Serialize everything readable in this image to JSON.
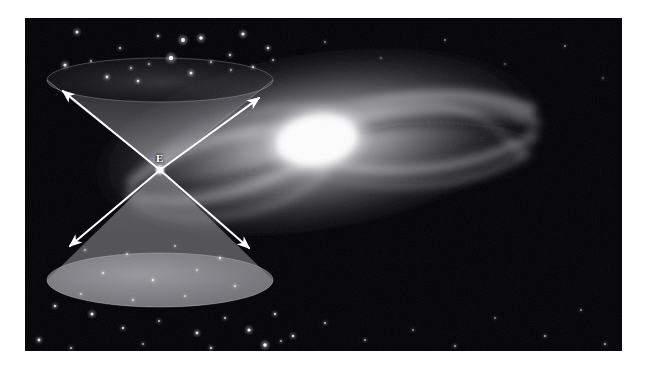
{
  "figure": {
    "kind": "astronomy-light-cone-diagram",
    "background_color": "#ffffff",
    "photo": {
      "x": 25,
      "y": 18,
      "width": 597,
      "height": 333,
      "sky_color": "#030305",
      "description": "spiral galaxy photograph with star field"
    }
  },
  "galaxy": {
    "name_label": "",
    "core": {
      "cx": 292,
      "cy": 122,
      "rx": 54,
      "ry": 33,
      "color": "#ffffff"
    },
    "disk": {
      "cx": 300,
      "cy": 126,
      "rx": 232,
      "ry": 92,
      "tilt_deg": -9,
      "color": "#b9b9bc"
    },
    "halo_color": "#6e6e74",
    "arm_count": 6
  },
  "light_cone": {
    "event_label": "E",
    "event_label_color": "#ffffff",
    "event_point": {
      "x": 135,
      "y": 152
    },
    "label_position": {
      "x": 131,
      "y": 135
    },
    "cone_fill": "#8d8d92",
    "cone_opacity": 0.55,
    "future_cone": {
      "name": "future-light-cone",
      "rim": {
        "cx": 135,
        "cy": 62,
        "rx": 113,
        "ry": 22
      },
      "direction": "up"
    },
    "past_cone": {
      "name": "past-light-cone",
      "rim": {
        "cx": 135,
        "cy": 262,
        "rx": 113,
        "ry": 27
      },
      "direction": "down"
    }
  },
  "arrows": {
    "color": "#ffffff",
    "items": [
      {
        "name": "arrow-upper-left",
        "x1": 135,
        "y1": 152,
        "x2": 38,
        "y2": 73
      },
      {
        "name": "arrow-upper-right",
        "x1": 135,
        "y1": 152,
        "x2": 234,
        "y2": 80
      },
      {
        "name": "arrow-lower-left",
        "x1": 135,
        "y1": 152,
        "x2": 45,
        "y2": 228
      },
      {
        "name": "arrow-lower-right",
        "x1": 135,
        "y1": 152,
        "x2": 224,
        "y2": 230
      }
    ]
  },
  "stars": {
    "color": "#ffffff",
    "points": [
      {
        "x": 52,
        "y": 14,
        "r": 1.5,
        "b": 0.85
      },
      {
        "x": 95,
        "y": 30,
        "r": 1.1,
        "b": 0.7
      },
      {
        "x": 133,
        "y": 18,
        "r": 1.2,
        "b": 0.75
      },
      {
        "x": 158,
        "y": 22,
        "r": 2.0,
        "b": 1.0
      },
      {
        "x": 176,
        "y": 20,
        "r": 1.8,
        "b": 0.95
      },
      {
        "x": 205,
        "y": 37,
        "r": 1.2,
        "b": 0.7
      },
      {
        "x": 218,
        "y": 16,
        "r": 1.6,
        "b": 0.9
      },
      {
        "x": 243,
        "y": 30,
        "r": 1.3,
        "b": 0.8
      },
      {
        "x": 40,
        "y": 47,
        "r": 1.6,
        "b": 0.9
      },
      {
        "x": 66,
        "y": 43,
        "r": 1.0,
        "b": 0.6
      },
      {
        "x": 82,
        "y": 59,
        "r": 1.4,
        "b": 0.85
      },
      {
        "x": 106,
        "y": 50,
        "r": 1.1,
        "b": 0.65
      },
      {
        "x": 113,
        "y": 63,
        "r": 1.3,
        "b": 0.8
      },
      {
        "x": 124,
        "y": 46,
        "r": 1.0,
        "b": 0.6
      },
      {
        "x": 146,
        "y": 40,
        "r": 2.2,
        "b": 1.0
      },
      {
        "x": 166,
        "y": 55,
        "r": 1.5,
        "b": 0.85
      },
      {
        "x": 186,
        "y": 44,
        "r": 1.1,
        "b": 0.65
      },
      {
        "x": 206,
        "y": 52,
        "r": 1.0,
        "b": 0.6
      },
      {
        "x": 228,
        "y": 49,
        "r": 1.2,
        "b": 0.7
      },
      {
        "x": 248,
        "y": 42,
        "r": 1.0,
        "b": 0.6
      },
      {
        "x": 60,
        "y": 232,
        "r": 1.0,
        "b": 0.6
      },
      {
        "x": 102,
        "y": 236,
        "r": 1.1,
        "b": 0.65
      },
      {
        "x": 150,
        "y": 228,
        "r": 1.0,
        "b": 0.6
      },
      {
        "x": 195,
        "y": 240,
        "r": 1.2,
        "b": 0.7
      },
      {
        "x": 78,
        "y": 255,
        "r": 1.1,
        "b": 0.7
      },
      {
        "x": 128,
        "y": 262,
        "r": 1.2,
        "b": 0.75
      },
      {
        "x": 172,
        "y": 252,
        "r": 1.0,
        "b": 0.6
      },
      {
        "x": 210,
        "y": 268,
        "r": 1.1,
        "b": 0.65
      },
      {
        "x": 56,
        "y": 276,
        "r": 1.0,
        "b": 0.6
      },
      {
        "x": 108,
        "y": 282,
        "r": 1.1,
        "b": 0.65
      },
      {
        "x": 160,
        "y": 278,
        "r": 1.0,
        "b": 0.6
      },
      {
        "x": 30,
        "y": 288,
        "r": 1.3,
        "b": 0.8
      },
      {
        "x": 67,
        "y": 296,
        "r": 1.5,
        "b": 0.9
      },
      {
        "x": 98,
        "y": 310,
        "r": 1.2,
        "b": 0.75
      },
      {
        "x": 134,
        "y": 303,
        "r": 1.1,
        "b": 0.65
      },
      {
        "x": 172,
        "y": 315,
        "r": 1.4,
        "b": 0.85
      },
      {
        "x": 200,
        "y": 300,
        "r": 1.1,
        "b": 0.7
      },
      {
        "x": 224,
        "y": 312,
        "r": 1.6,
        "b": 0.95
      },
      {
        "x": 250,
        "y": 296,
        "r": 1.2,
        "b": 0.75
      },
      {
        "x": 268,
        "y": 318,
        "r": 1.3,
        "b": 0.8
      },
      {
        "x": 14,
        "y": 322,
        "r": 1.4,
        "b": 0.85
      },
      {
        "x": 46,
        "y": 330,
        "r": 1.1,
        "b": 0.65
      },
      {
        "x": 118,
        "y": 326,
        "r": 1.0,
        "b": 0.6
      },
      {
        "x": 186,
        "y": 330,
        "r": 1.2,
        "b": 0.7
      },
      {
        "x": 240,
        "y": 327,
        "r": 1.8,
        "b": 1.0
      },
      {
        "x": 256,
        "y": 323,
        "r": 1.0,
        "b": 0.6
      },
      {
        "x": 300,
        "y": 305,
        "r": 1.1,
        "b": 0.65
      },
      {
        "x": 340,
        "y": 322,
        "r": 1.0,
        "b": 0.6
      },
      {
        "x": 388,
        "y": 312,
        "r": 0.9,
        "b": 0.55
      },
      {
        "x": 430,
        "y": 328,
        "r": 1.0,
        "b": 0.6
      },
      {
        "x": 470,
        "y": 300,
        "r": 0.9,
        "b": 0.5
      },
      {
        "x": 520,
        "y": 318,
        "r": 1.0,
        "b": 0.6
      },
      {
        "x": 556,
        "y": 292,
        "r": 0.9,
        "b": 0.55
      },
      {
        "x": 580,
        "y": 326,
        "r": 1.0,
        "b": 0.6
      },
      {
        "x": 300,
        "y": 24,
        "r": 0.9,
        "b": 0.5
      },
      {
        "x": 356,
        "y": 40,
        "r": 0.8,
        "b": 0.45
      },
      {
        "x": 420,
        "y": 22,
        "r": 0.9,
        "b": 0.5
      },
      {
        "x": 480,
        "y": 46,
        "r": 0.8,
        "b": 0.45
      },
      {
        "x": 540,
        "y": 28,
        "r": 0.9,
        "b": 0.5
      },
      {
        "x": 578,
        "y": 60,
        "r": 0.8,
        "b": 0.45
      }
    ]
  }
}
